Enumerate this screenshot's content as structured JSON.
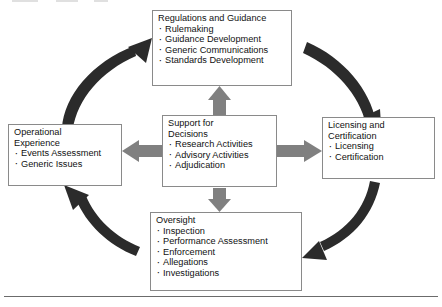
{
  "diagram": {
    "colors": {
      "curved_arrow": "#2b2b2b",
      "straight_arrow": "#808080",
      "box_border": "#8a8a8a",
      "text": "#111111",
      "background": "#ffffff",
      "rule": "#6b6b6b"
    },
    "nodes": [
      {
        "id": "regulations",
        "title": "Regulations and Guidance",
        "items": [
          "Rulemaking",
          "Guidance Development",
          "Generic Communications",
          "Standards Development"
        ]
      },
      {
        "id": "operational",
        "title": "Operational\nExperience",
        "items": [
          "Events Assessment",
          "Generic Issues"
        ]
      },
      {
        "id": "support",
        "title": "Support for\nDecisions",
        "items": [
          "Research Activities",
          "Advisory Activities",
          "Adjudication"
        ]
      },
      {
        "id": "licensing",
        "title": "Licensing and\nCertification",
        "items": [
          "Licensing",
          "Certification"
        ]
      },
      {
        "id": "oversight",
        "title": "Oversight",
        "items": [
          "Inspection",
          "Performance Assessment",
          "Enforcement",
          "Allegations",
          "Investigations"
        ]
      }
    ],
    "connections": [
      {
        "id": "operational-to-regulations",
        "style": "curved",
        "from": "operational",
        "to": "regulations"
      },
      {
        "id": "regulations-to-licensing",
        "style": "curved",
        "from": "regulations",
        "to": "licensing"
      },
      {
        "id": "licensing-to-oversight",
        "style": "curved",
        "from": "licensing",
        "to": "oversight"
      },
      {
        "id": "oversight-to-operational",
        "style": "curved",
        "from": "oversight",
        "to": "operational"
      },
      {
        "id": "support-to-regulations",
        "style": "straight",
        "from": "support",
        "to": "regulations"
      },
      {
        "id": "support-to-operational",
        "style": "straight",
        "from": "support",
        "to": "operational"
      },
      {
        "id": "support-to-licensing",
        "style": "straight",
        "from": "support",
        "to": "licensing"
      },
      {
        "id": "support-to-oversight",
        "style": "straight",
        "from": "support",
        "to": "oversight"
      }
    ]
  }
}
